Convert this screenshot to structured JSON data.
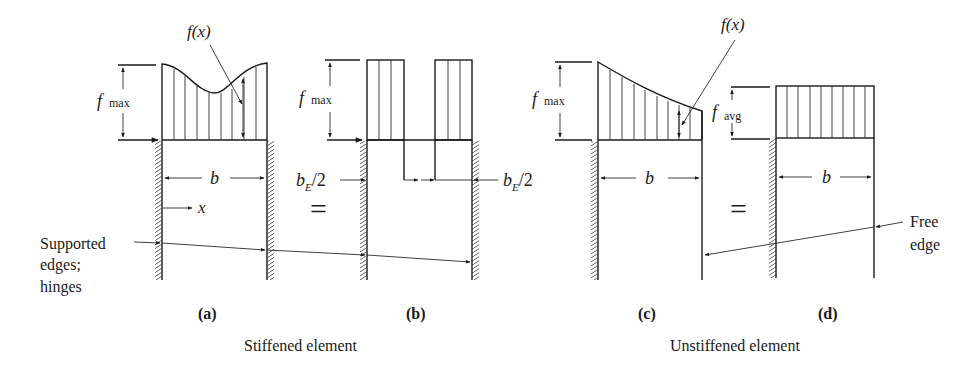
{
  "figure": {
    "panels": [
      {
        "id": "a",
        "label": "(a)",
        "type": "stiffened-actual-stress"
      },
      {
        "id": "b",
        "label": "(b)",
        "type": "stiffened-effective-width"
      },
      {
        "id": "c",
        "label": "(c)",
        "type": "unstiffened-actual-stress"
      },
      {
        "id": "d",
        "label": "(d)",
        "type": "unstiffened-average-stress"
      }
    ],
    "labels": {
      "fx": "f(x)",
      "f": "f",
      "max": "max",
      "avg": "avg",
      "b": "b",
      "bE": "b",
      "E": "E",
      "half": "/2",
      "x": "x",
      "equals": "=",
      "supported_line1": "Supported",
      "supported_line2": "edges;",
      "supported_line3": "hinges",
      "free_line1": "Free",
      "free_line2": "edge"
    },
    "captions": {
      "stiffened": "Stiffened element",
      "unstiffened": "Unstiffened element"
    }
  }
}
